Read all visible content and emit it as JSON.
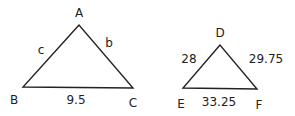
{
  "diagram": {
    "triangle_abc": {
      "vertices": {
        "A": "A",
        "B": "B",
        "C": "C"
      },
      "sides": {
        "c": "c",
        "b": "b",
        "a": "9.5"
      }
    },
    "triangle_def": {
      "vertices": {
        "D": "D",
        "E": "E",
        "F": "F"
      },
      "sides": {
        "DE": "28",
        "DF": "29.75",
        "EF": "33.25"
      }
    }
  }
}
